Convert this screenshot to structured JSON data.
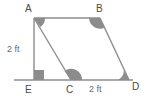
{
  "figure": {
    "background_color": "#ffffff",
    "stroke_color": "#8c8c8c",
    "angle_fill_color": "#8c8c8c",
    "label_color": "#4a4a4a",
    "measure_color": "#6b6b6b",
    "vertices": {
      "A": {
        "label": "A",
        "x": 34,
        "y": 18
      },
      "B": {
        "label": "B",
        "x": 100,
        "y": 18
      },
      "C": {
        "label": "C",
        "x": 71,
        "y": 80
      },
      "D": {
        "label": "D",
        "x": 129,
        "y": 80
      },
      "E": {
        "label": "E",
        "x": 34,
        "y": 80
      }
    },
    "segments": [
      {
        "name": "AB",
        "from": "A",
        "to": "B"
      },
      {
        "name": "AC",
        "from": "A",
        "to": "C"
      },
      {
        "name": "BD",
        "from": "B",
        "to": "D"
      },
      {
        "name": "AE",
        "from": "A",
        "to": "E"
      },
      {
        "name": "baseline",
        "from": "E",
        "to": "D"
      }
    ],
    "measures": {
      "height_ae": "2 ft",
      "base_cd": "2 ft"
    },
    "angle_marks": [
      {
        "at": "A",
        "type": "wedge"
      },
      {
        "at": "B",
        "type": "wedge"
      },
      {
        "at": "C",
        "type": "wedge"
      },
      {
        "at": "D",
        "type": "wedge"
      },
      {
        "at": "E",
        "type": "right-angle-square"
      }
    ]
  }
}
